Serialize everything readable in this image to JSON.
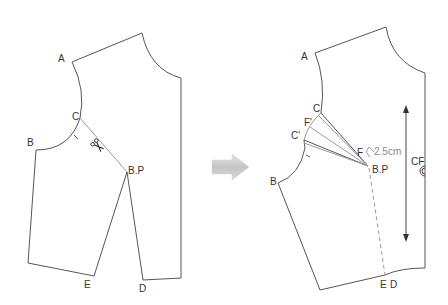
{
  "figure_before": {
    "labels": {
      "A": "A",
      "B": "B",
      "C": "C",
      "BP": "B.P",
      "E": "E",
      "D": "D"
    },
    "cut_icon": "scissors-icon"
  },
  "transition": {
    "arrow_icon": "arrow-right-icon",
    "arrow_color": "#c8c8c8"
  },
  "figure_after": {
    "labels": {
      "A": "A",
      "B": "B",
      "C": "C",
      "C_prime": "C'",
      "F_prime": "F'",
      "F": "F",
      "BP": "B.P",
      "E": "E",
      "D": "D",
      "CF": "CF"
    },
    "measurement": "2.5cm",
    "grainline_icon": "grainline-arrow-icon",
    "button_icon": "button-mark-icon"
  },
  "colors": {
    "outline": "#555555",
    "guide": "#9a9a9a",
    "label": "#333333",
    "measure_text": "#8a8a8a"
  }
}
